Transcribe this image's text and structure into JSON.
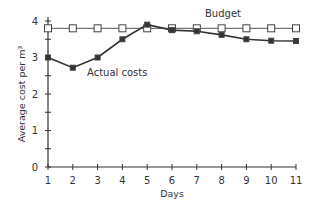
{
  "chart_data": {
    "type": "line",
    "title": "",
    "xlabel": "Days",
    "ylabel": "Average cost per m³",
    "x": [
      1,
      2,
      3,
      4,
      5,
      6,
      7,
      8,
      9,
      10,
      11
    ],
    "xticks": [
      "1",
      "2",
      "3",
      "4",
      "5",
      "6",
      "7",
      "8",
      "9",
      "10",
      "11"
    ],
    "yticks": [
      "0",
      "1",
      "2",
      "3",
      "4"
    ],
    "ylim": [
      0,
      4
    ],
    "xlim": [
      1,
      11
    ],
    "grid": false,
    "series": [
      {
        "name": "Budget",
        "marker": "open-square",
        "values": [
          3.8,
          3.8,
          3.8,
          3.8,
          3.8,
          3.8,
          3.8,
          3.8,
          3.8,
          3.8,
          3.8
        ]
      },
      {
        "name": "Actual costs",
        "marker": "filled-square",
        "values": [
          3.0,
          2.72,
          3.0,
          3.5,
          3.9,
          3.75,
          3.72,
          3.62,
          3.5,
          3.46,
          3.45
        ]
      }
    ],
    "annotations": [
      {
        "text": "Budget",
        "series": "Budget"
      },
      {
        "text": "Actual costs",
        "series": "Actual costs"
      }
    ]
  }
}
